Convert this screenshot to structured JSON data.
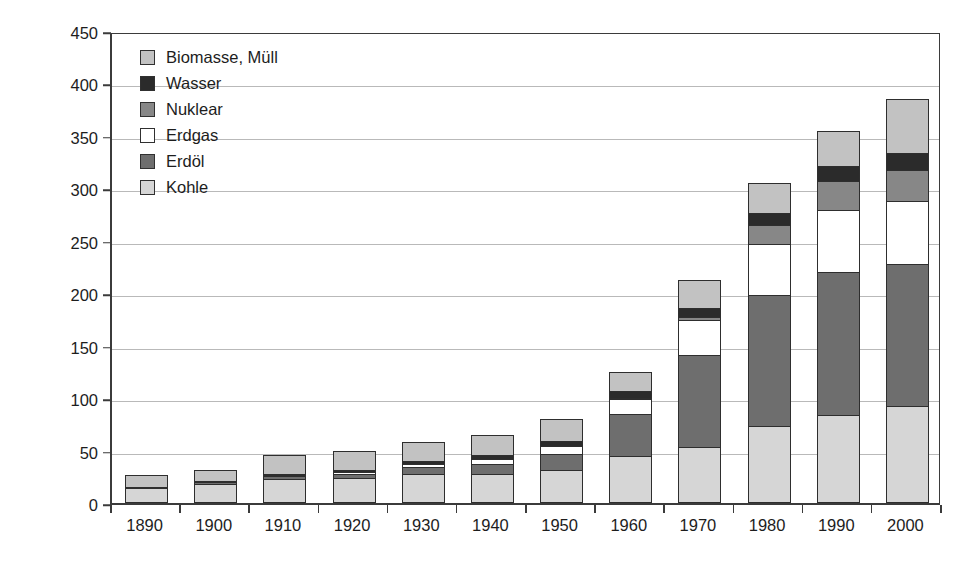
{
  "chart_data": {
    "type": "bar",
    "subtype": "stacked-bar",
    "title": "",
    "xlabel": "",
    "ylabel": "Verbrauch (EJ)",
    "ylim": [
      0,
      450
    ],
    "ytick_values": [
      0,
      50,
      100,
      150,
      200,
      250,
      300,
      350,
      400,
      450
    ],
    "ytick_labels": [
      "0",
      "50",
      "100",
      "150",
      "200",
      "250",
      "300",
      "350",
      "400",
      "450"
    ],
    "grid": true,
    "grid_axis": "y",
    "legend_position": "upper left",
    "categories": [
      "1890",
      "1900",
      "1910",
      "1920",
      "1930",
      "1940",
      "1950",
      "1960",
      "1970",
      "1980",
      "1990",
      "2000"
    ],
    "stack_order_bottom_to_top": [
      "Kohle",
      "Erdöl",
      "Erdgas",
      "Nuklear",
      "Wasser",
      "Biomasse, Müll"
    ],
    "series": [
      {
        "name": "Kohle",
        "color": "#d6d6d6",
        "values": [
          13,
          17,
          22,
          23,
          27,
          27,
          31,
          44,
          52,
          72,
          83,
          92
        ]
      },
      {
        "name": "Erdöl",
        "color": "#6e6e6e",
        "values": [
          1,
          2,
          3,
          4,
          6,
          9,
          15,
          40,
          88,
          125,
          136,
          135
        ]
      },
      {
        "name": "Erdgas",
        "color": "#ffffff",
        "values": [
          0,
          1,
          1,
          2,
          3,
          5,
          7,
          14,
          34,
          49,
          59,
          60
        ]
      },
      {
        "name": "Nuklear",
        "color": "#878787",
        "values": [
          0,
          0,
          0,
          0,
          0,
          0,
          0,
          1,
          2,
          18,
          28,
          30
        ]
      },
      {
        "name": "Wasser",
        "color": "#2b2b2b",
        "values": [
          0,
          0,
          1,
          2,
          3,
          4,
          5,
          7,
          9,
          12,
          14,
          16
        ]
      },
      {
        "name": "Biomasse, Müll",
        "color": "#c2c2c2",
        "values": [
          12,
          11,
          18,
          18,
          18,
          19,
          21,
          18,
          27,
          28,
          34,
          51
        ]
      }
    ],
    "totals": [
      26,
      31,
      45,
      49,
      57,
      64,
      79,
      124,
      212,
      304,
      354,
      384
    ],
    "annotations": []
  },
  "legend": {
    "entries": [
      {
        "label": "Biomasse, Müll",
        "color": "#c2c2c2"
      },
      {
        "label": "Wasser",
        "color": "#2b2b2b"
      },
      {
        "label": "Nuklear",
        "color": "#878787"
      },
      {
        "label": "Erdgas",
        "color": "#ffffff"
      },
      {
        "label": "Erdöl",
        "color": "#6e6e6e"
      },
      {
        "label": "Kohle",
        "color": "#d6d6d6"
      }
    ]
  },
  "axes": {
    "y_title": "Verbrauch (EJ)"
  },
  "colors": {
    "axis": "#3b3b3b",
    "grid": "#b9b9b9",
    "bar_outline": "#2e2e2e",
    "background": "#ffffff",
    "text": "#1d1d1d"
  }
}
